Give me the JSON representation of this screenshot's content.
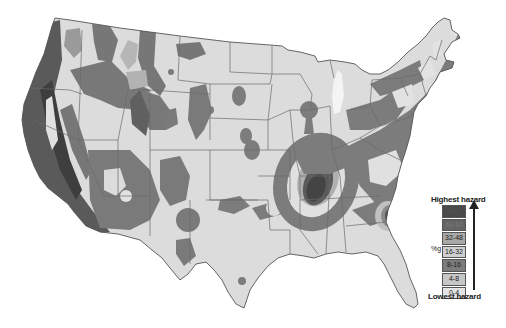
{
  "map": {
    "subject": "United States seismic hazard map",
    "colors": {
      "background": "#ffffff",
      "land_lowest": "#dcdcdc",
      "hazard_0_4": "#e2e2e2",
      "hazard_4_8": "#cfcfcf",
      "hazard_8_16": "#7f7f7f",
      "hazard_16_32": "#b8b8b8",
      "hazard_32_48": "#8e8e8e",
      "hazard_48_64": "#5e5e5e",
      "hazard_64_plus": "#454545",
      "border": "#6a6a6a",
      "lake": "#f4f4f4"
    }
  },
  "legend": {
    "top_label": "Highest hazard",
    "bottom_label": "Lowest hazard",
    "unit": "%g",
    "categories": [
      {
        "label": "64+",
        "color": "#4a4a4a"
      },
      {
        "label": "48-64",
        "color": "#646464"
      },
      {
        "label": "32-48",
        "color": "#a8a8a8"
      },
      {
        "label": "16-32",
        "color": "#cfcfcf"
      },
      {
        "label": "8-16",
        "color": "#7c7c7c"
      },
      {
        "label": "4-8",
        "color": "#c6c6c6"
      },
      {
        "label": "0-4",
        "color": "#e4e4e4"
      }
    ]
  }
}
